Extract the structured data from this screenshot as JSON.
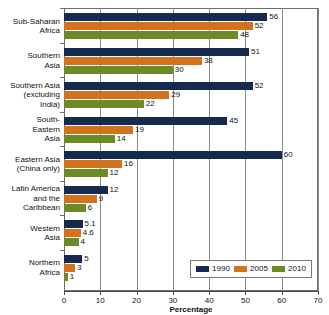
{
  "chart_data": {
    "type": "bar",
    "orientation": "horizontal",
    "title": "",
    "xlabel": "Percentage",
    "ylabel": "",
    "xlim": [
      0,
      70
    ],
    "xticks": [
      0,
      10,
      20,
      30,
      40,
      50,
      60,
      70
    ],
    "grid": true,
    "legend_position": "bottom-right",
    "categories": [
      "Sub-Saharan Africa",
      "Southern Asia",
      "Southern Asia (excluding India)",
      "South-Eastern Asia",
      "Eastern Asia (China only)",
      "Latin America and the Caribbean",
      "Western Asia",
      "Northern Africa"
    ],
    "series": [
      {
        "name": "1990",
        "color": "#152a4e",
        "values": [
          56,
          51,
          52,
          45,
          60,
          12,
          5.1,
          5
        ]
      },
      {
        "name": "2005",
        "color": "#d4711c",
        "values": [
          52,
          38,
          29,
          19,
          16,
          9,
          4.6,
          3
        ]
      },
      {
        "name": "2010",
        "color": "#6b8b26",
        "values": [
          48,
          30,
          22,
          14,
          12,
          6,
          4,
          1
        ]
      }
    ]
  },
  "categories_display": [
    [
      "Sub-Saharan",
      "Africa"
    ],
    [
      "Southern",
      "Asia"
    ],
    [
      "Southern Asia",
      "(excluding",
      "India)"
    ],
    [
      "South-",
      "Eastern",
      "Asia"
    ],
    [
      "Eastern Asia",
      "(China only)"
    ],
    [
      "Latin America",
      "and the",
      "Caribbean"
    ],
    [
      "Western",
      "Asia"
    ],
    [
      "Northern",
      "Africa"
    ]
  ],
  "value_labels": [
    [
      "56",
      "52",
      "48"
    ],
    [
      "51",
      "38",
      "30"
    ],
    [
      "52",
      "29",
      "22"
    ],
    [
      "45",
      "19",
      "14"
    ],
    [
      "60",
      "16",
      "12"
    ],
    [
      "12",
      "9",
      "6"
    ],
    [
      "5.1",
      "4.6",
      "4"
    ],
    [
      "5",
      "3",
      "1"
    ]
  ],
  "xtick_labels": [
    "0",
    "10",
    "20",
    "30",
    "40",
    "50",
    "60",
    "70"
  ],
  "axis": {
    "title": "Percentage"
  },
  "legend": {
    "items": [
      {
        "label": "1990",
        "color": "#152a4e"
      },
      {
        "label": "2005",
        "color": "#d4711c"
      },
      {
        "label": "2010",
        "color": "#6b8b26"
      }
    ]
  }
}
